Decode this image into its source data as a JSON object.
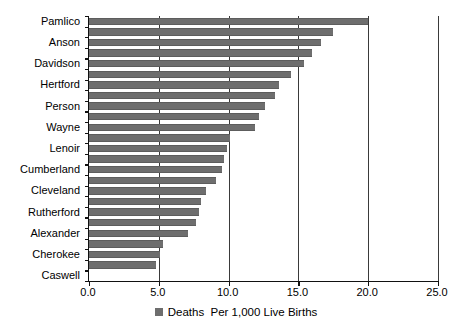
{
  "chart_data": {
    "type": "bar",
    "orientation": "horizontal",
    "title": "",
    "xlabel": "Deaths  Per 1,000 Live Births",
    "ylabel": "",
    "xlim": [
      0.0,
      25.0
    ],
    "xticks": [
      "0.0",
      "5.0",
      "10.0",
      "15.0",
      "20.0",
      "25.0"
    ],
    "xtick_values": [
      0.0,
      5.0,
      10.0,
      15.0,
      20.0,
      25.0
    ],
    "grid": true,
    "grid_axis": "x",
    "legend": [
      "Deaths  Per 1,000 Live Births"
    ],
    "legend_position": "bottom",
    "series_color": "#6e6e6e",
    "categories": [
      "Pamlico",
      "",
      "Anson",
      "",
      "Davidson",
      "",
      "Hertford",
      "",
      "Person",
      "",
      "Wayne",
      "",
      "Lenoir",
      "",
      "Cumberland",
      "",
      "Cleveland",
      "",
      "Rutherford",
      "",
      "Alexander",
      "",
      "Cherokee",
      "",
      "Caswell"
    ],
    "labeled_categories": [
      "Pamlico",
      "Anson",
      "Davidson",
      "Hertford",
      "Person",
      "Wayne",
      "Lenoir",
      "Cumberland",
      "Cleveland",
      "Rutherford",
      "Alexander",
      "Cherokee",
      "Caswell"
    ],
    "values": [
      20.0,
      17.5,
      16.6,
      16.0,
      15.4,
      14.5,
      13.6,
      13.3,
      12.6,
      12.2,
      11.9,
      10.1,
      9.9,
      9.7,
      9.5,
      9.1,
      8.4,
      8.0,
      7.9,
      7.7,
      7.1,
      5.3,
      5.1,
      4.8,
      0.0
    ]
  }
}
